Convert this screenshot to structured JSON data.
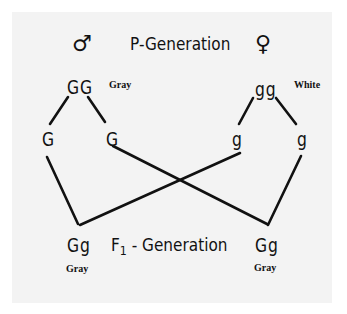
{
  "diagram": {
    "colors": {
      "background": "#ffffff",
      "panel": "#f3f3f3",
      "ink": "#111111"
    },
    "p_generation": {
      "label": "P-Generation",
      "male": {
        "symbol": "♂",
        "symbol_name": "male-symbol",
        "genotype": "GG",
        "phenotype": "Gray",
        "gametes": [
          "G",
          "G"
        ]
      },
      "female": {
        "symbol": "♀",
        "symbol_name": "female-symbol",
        "genotype": "gg",
        "phenotype": "White",
        "gametes": [
          "g",
          "g"
        ]
      }
    },
    "f1_generation": {
      "label_prefix": "F",
      "label_subscript": "1",
      "label_suffix": " - Generation",
      "offspring": [
        {
          "genotype": "Gg",
          "phenotype": "Gray"
        },
        {
          "genotype": "Gg",
          "phenotype": "Gray"
        }
      ]
    },
    "connections": [
      {
        "from": "GG",
        "to": "gamete-G-1"
      },
      {
        "from": "GG",
        "to": "gamete-G-2"
      },
      {
        "from": "gg",
        "to": "gamete-g-1"
      },
      {
        "from": "gg",
        "to": "gamete-g-2"
      },
      {
        "from": "gamete-G-1",
        "to": "offspring-1"
      },
      {
        "from": "gamete-g-1",
        "to": "offspring-1"
      },
      {
        "from": "gamete-G-2",
        "to": "offspring-2"
      },
      {
        "from": "gamete-g-2",
        "to": "offspring-2"
      }
    ]
  }
}
